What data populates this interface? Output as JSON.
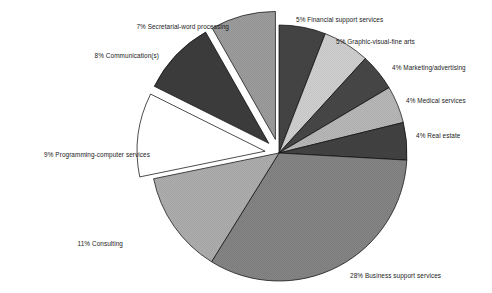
{
  "chart_data": {
    "type": "pie",
    "title": "",
    "subtitle": "",
    "xlabel": "",
    "ylabel": "",
    "legend_position": "none",
    "grid": false,
    "labels_format": "{pct}% {category}",
    "start_angle_deg": 0,
    "direction": "clockwise",
    "categories": [
      "Financial support services",
      "Graphic-visual-fine arts",
      "Marketing/advertising",
      "Medical services",
      "Real estate",
      "Business support services",
      "Consulting",
      "Programming-computer services",
      "Communication(s)",
      "Secretarial-word processing"
    ],
    "values": [
      5,
      5,
      4,
      4,
      4,
      28,
      11,
      9,
      8,
      7
    ],
    "units": "percent",
    "total": 85,
    "slices": [
      {
        "category": "Financial support services",
        "value": 5,
        "label": "5% Financial support services",
        "color": "#3c3c3c",
        "exploded": false,
        "start_deg": 0,
        "end_deg": 21.2
      },
      {
        "category": "Graphic-visual-fine arts",
        "value": 5,
        "label": "5% Graphic-visual-fine arts",
        "color": "#cdcdcd",
        "exploded": false,
        "start_deg": 21.2,
        "end_deg": 42.4
      },
      {
        "category": "Marketing/advertising",
        "value": 4,
        "label": "4% Marketing/advertising",
        "color": "#3f3f3f",
        "exploded": false,
        "start_deg": 42.4,
        "end_deg": 59.3
      },
      {
        "category": "Medical services",
        "value": 4,
        "label": "4% Medical services",
        "color": "#b4b4b4",
        "exploded": false,
        "start_deg": 59.3,
        "end_deg": 76.2
      },
      {
        "category": "Real estate",
        "value": 4,
        "label": "4% Real estate",
        "color": "#3a3a3a",
        "exploded": false,
        "start_deg": 76.2,
        "end_deg": 93.2
      },
      {
        "category": "Business support services",
        "value": 28,
        "label": "28% Business support services",
        "color": "#7e7e7e",
        "exploded": false,
        "start_deg": 93.2,
        "end_deg": 211.8
      },
      {
        "category": "Consulting",
        "value": 11,
        "label": "11% Consulting",
        "color": "#a9a9a9",
        "exploded": false,
        "start_deg": 211.8,
        "end_deg": 258.4
      },
      {
        "category": "Programming-computer services",
        "value": 9,
        "label": "9% Programming-computer services",
        "color": "#ffffff",
        "exploded": true,
        "start_deg": 258.4,
        "end_deg": 296.5
      },
      {
        "category": "Communication(s)",
        "value": 8,
        "label": "8% Communication(s)",
        "color": "#343434",
        "exploded": true,
        "start_deg": 296.5,
        "end_deg": 330.4
      },
      {
        "category": "Secretarial-word processing",
        "value": 7,
        "label": "7% Secretarial-word processing",
        "color": "#989898",
        "exploded": true,
        "start_deg": 330.4,
        "end_deg": 360
      }
    ],
    "geometry": {
      "center_x": 279,
      "center_y": 153,
      "radius": 128,
      "explode_offset": 14,
      "outline_color": "#000000",
      "outline_width": 0.7,
      "background": "#ffffff"
    },
    "label_positions": [
      {
        "category": "Financial support services",
        "x": 296,
        "y": 15,
        "align": "left"
      },
      {
        "category": "Graphic-visual-fine arts",
        "x": 336,
        "y": 37,
        "align": "left"
      },
      {
        "category": "Marketing/advertising",
        "x": 392,
        "y": 63,
        "align": "left"
      },
      {
        "category": "Medical services",
        "x": 406,
        "y": 96,
        "align": "left"
      },
      {
        "category": "Real estate",
        "x": 416,
        "y": 131,
        "align": "left"
      },
      {
        "category": "Business support services",
        "x": 350,
        "y": 271,
        "align": "left"
      },
      {
        "category": "Consulting",
        "x": 123,
        "y": 239,
        "align": "right"
      },
      {
        "category": "Programming-computer services",
        "x": 150,
        "y": 150,
        "align": "right"
      },
      {
        "category": "Communication(s)",
        "x": 159,
        "y": 51,
        "align": "right"
      },
      {
        "category": "Secretarial-word processing",
        "x": 229,
        "y": 22,
        "align": "right"
      }
    ]
  }
}
